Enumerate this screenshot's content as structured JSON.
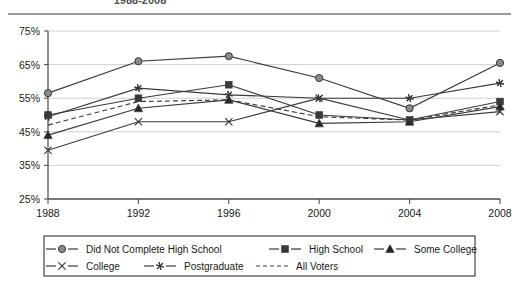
{
  "chart_data": {
    "type": "line",
    "title": "1988-2008",
    "xlabel": "",
    "ylabel": "",
    "categories": [
      "1988",
      "1992",
      "1996",
      "2000",
      "2004",
      "2008"
    ],
    "x": [
      1988,
      1992,
      1996,
      2000,
      2004,
      2008
    ],
    "ylim": [
      25,
      75
    ],
    "ytick_labels": [
      "25%",
      "35%",
      "45%",
      "55%",
      "65%",
      "75%"
    ],
    "yticks": [
      25,
      35,
      45,
      55,
      65,
      75
    ],
    "grid": true,
    "legend_position": "bottom",
    "series": [
      {
        "name": "Did Not Complete High School",
        "marker": "circle",
        "values": [
          56.5,
          66.0,
          67.5,
          61.0,
          52.0,
          65.5
        ]
      },
      {
        "name": "High School",
        "marker": "square",
        "values": [
          50.0,
          55.0,
          59.0,
          50.0,
          48.5,
          54.0
        ]
      },
      {
        "name": "Some College",
        "marker": "triangle",
        "values": [
          44.0,
          52.0,
          54.5,
          47.5,
          48.0,
          52.5
        ]
      },
      {
        "name": "College",
        "marker": "cross",
        "values": [
          39.5,
          48.0,
          48.0,
          55.0,
          48.5,
          51.0
        ]
      },
      {
        "name": "Postgraduate",
        "marker": "asterisk",
        "values": [
          49.5,
          58.0,
          56.0,
          55.0,
          55.0,
          59.5
        ]
      },
      {
        "name": "All Voters",
        "marker": "none",
        "dashed": true,
        "values": [
          47.0,
          54.0,
          54.5,
          49.5,
          48.5,
          53.0
        ]
      }
    ]
  },
  "legend": {
    "row1": [
      "Did Not Complete High School",
      "High School",
      "Some College"
    ],
    "row2": [
      "College",
      "Postgraduate",
      "All Voters"
    ]
  },
  "colors": {
    "line": "#3a3a3a",
    "grid": "#c9c9c9",
    "axis": "#555555",
    "marker_fill": "#8a8a8a",
    "text": "#1a1a1a"
  }
}
